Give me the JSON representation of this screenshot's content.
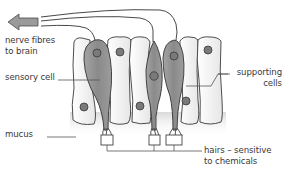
{
  "diagram": {
    "labels": {
      "nerve_fibres_line1": "nerve fibres",
      "nerve_fibres_line2": "to brain",
      "sensory_cell": "sensory cell",
      "supporting_cells_line1": "supporting",
      "supporting_cells_line2": "cells",
      "mucus": "mucus",
      "hairs_line1": "hairs – sensitive",
      "hairs_line2": "to chemicals"
    },
    "colors": {
      "sensory_cell_fill": "#8e8e8e",
      "supporting_cell_fill": "#f1f1f1",
      "nucleus_fill": "#7a7a7a",
      "outline": "#333333",
      "arrow_fill": "#9a9a9a",
      "mucus_shade": "#dcdcdc",
      "leader_line": "#555555"
    },
    "structures": [
      "nerve-fibre-arrow",
      "nerve-fibres",
      "supporting-cells",
      "sensory-cells",
      "nuclei",
      "mucus-layer",
      "hairs"
    ]
  }
}
